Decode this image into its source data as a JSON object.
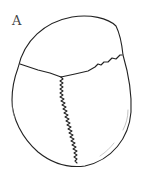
{
  "figure": {
    "panel_label": "A",
    "line_color": "#222222",
    "background": "#ffffff"
  }
}
